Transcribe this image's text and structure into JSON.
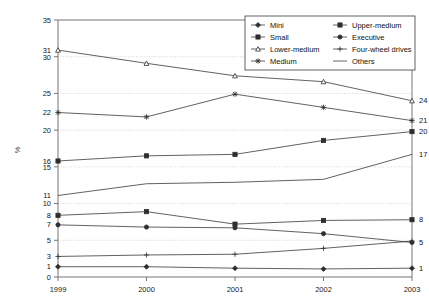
{
  "chart_data": {
    "type": "line",
    "title": "",
    "xlabel": "",
    "ylabel": "%",
    "categories": [
      "1999",
      "2000",
      "2001",
      "2002",
      "2003"
    ],
    "x": [
      1999,
      2000,
      2001,
      2002,
      2003
    ],
    "ylim": [
      0,
      35
    ],
    "ytick_step": 5,
    "yticks": [
      0,
      5,
      10,
      15,
      20,
      25,
      30,
      35
    ],
    "grid": true,
    "legend_position": "top-right",
    "legend_columns": 2,
    "series": [
      {
        "name": "Mini",
        "marker": "diamond",
        "values": [
          1.4,
          1.4,
          1.2,
          1.1,
          1.2
        ]
      },
      {
        "name": "Small",
        "marker": "square",
        "values": [
          15.8,
          16.5,
          16.7,
          18.6,
          19.8
        ]
      },
      {
        "name": "Lower-medium",
        "marker": "triangle",
        "values": [
          30.9,
          29.1,
          27.4,
          26.6,
          24.0
        ]
      },
      {
        "name": "Medium",
        "marker": "cross-x",
        "values": [
          22.4,
          21.8,
          24.9,
          23.1,
          21.3
        ]
      },
      {
        "name": "Upper-medium",
        "marker": "square",
        "values": [
          8.4,
          8.9,
          7.2,
          7.7,
          7.8
        ]
      },
      {
        "name": "Executive",
        "marker": "circle",
        "values": [
          7.1,
          6.8,
          6.7,
          5.9,
          4.7
        ]
      },
      {
        "name": "Four-wheel drives",
        "marker": "plus",
        "values": [
          2.8,
          3.0,
          3.1,
          3.9,
          4.9
        ]
      },
      {
        "name": "Others",
        "marker": "none",
        "values": [
          11.1,
          12.7,
          12.9,
          13.3,
          16.7
        ]
      }
    ],
    "left_labels": [
      "31",
      "22",
      "16",
      "11",
      "8",
      "7",
      "3",
      "1"
    ],
    "right_labels": [
      "24",
      "21",
      "20",
      "17",
      "8",
      "5",
      "1"
    ],
    "annotations": {
      "left": [
        {
          "text": "31",
          "series": "Lower-medium",
          "year": "1999"
        },
        {
          "text": "22",
          "series": "Medium",
          "year": "1999"
        },
        {
          "text": "16",
          "series": "Small",
          "year": "1999"
        },
        {
          "text": "11",
          "series": "Others",
          "year": "1999"
        },
        {
          "text": "8",
          "series": "Upper-medium",
          "year": "1999"
        },
        {
          "text": "7",
          "series": "Executive",
          "year": "1999"
        },
        {
          "text": "3",
          "series": "Four-wheel drives",
          "year": "1999"
        },
        {
          "text": "1",
          "series": "Mini",
          "year": "1999"
        }
      ],
      "right": [
        {
          "text": "24",
          "series": "Lower-medium",
          "year": "2003"
        },
        {
          "text": "21",
          "series": "Medium",
          "year": "2003"
        },
        {
          "text": "20",
          "series": "Small",
          "year": "2003"
        },
        {
          "text": "17",
          "series": "Others",
          "year": "2003"
        },
        {
          "text": "8",
          "series": "Upper-medium",
          "year": "2003"
        },
        {
          "text": "5",
          "series": "Executive",
          "year": "2003"
        },
        {
          "text": "1",
          "series": "Mini",
          "year": "2003"
        }
      ]
    },
    "colors": {
      "line": "#3a3a3a",
      "grid": "#b9b9b9",
      "axis": "#777777",
      "text": "#111111"
    }
  },
  "axis": {
    "y_label": "%",
    "y_ticks": [
      "0",
      "5",
      "10",
      "15",
      "20",
      "25",
      "30",
      "35"
    ],
    "x_ticks": [
      "1999",
      "2000",
      "2001",
      "2002",
      "2003"
    ]
  },
  "legend": {
    "items": [
      {
        "label": "Mini"
      },
      {
        "label": "Upper-medium"
      },
      {
        "label": "Small"
      },
      {
        "label": "Executive"
      },
      {
        "label": "Lower-medium"
      },
      {
        "label": "Four-wheel drives"
      },
      {
        "label": "Medium"
      },
      {
        "label": "Others"
      }
    ]
  }
}
